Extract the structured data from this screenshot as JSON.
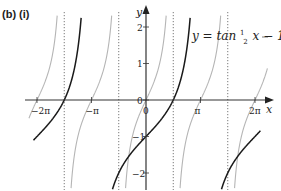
{
  "labels": {
    "part": "(b)  (i)",
    "equation_prefix": "y = tan ",
    "equation_frac_num": "1",
    "equation_frac_den": "2",
    "equation_suffix": "x − 1",
    "x_axis": "x",
    "y_axis": "y",
    "origin": "0"
  },
  "colors": {
    "main_curve": "#1a1a1a",
    "reference_curve": "#b5b5b5",
    "axes": "#333333",
    "asymptote": "#555555"
  },
  "chart_data": {
    "type": "line",
    "xlabel": "x",
    "ylabel": "y",
    "xlim": [
      -7.0,
      7.6
    ],
    "ylim": [
      -2.4,
      2.4
    ],
    "grid": false,
    "x_ticks": [
      {
        "value": -6.2832,
        "label": "−2π"
      },
      {
        "value": -3.1416,
        "label": "−π"
      },
      {
        "value": 0,
        "label": "0"
      },
      {
        "value": 3.1416,
        "label": "π"
      },
      {
        "value": 6.2832,
        "label": "2π"
      }
    ],
    "y_ticks": [
      {
        "value": 2,
        "label": "2"
      },
      {
        "value": 1,
        "label": "1"
      },
      {
        "value": 0,
        "label": "0"
      },
      {
        "value": -1,
        "label": "−1"
      },
      {
        "value": -2,
        "label": "−2"
      }
    ],
    "asymptotes_x": [
      -4.7124,
      -1.5708,
      1.5708,
      4.7124
    ],
    "series": [
      {
        "name": "y = tan ½x − 1",
        "style": "solid-black",
        "function": "tan(x/2) - 1",
        "domain": [
          -6.6,
          6.6
        ]
      },
      {
        "name": "y = tan x",
        "style": "solid-grey",
        "function": "tan(x)",
        "domain": [
          -6.6,
          6.6
        ]
      }
    ],
    "sample_points_main": [
      {
        "x": -6.2832,
        "y": -1
      },
      {
        "x": -4.7124,
        "y": 0
      },
      {
        "x": -3.6,
        "y": 2.17
      },
      {
        "x": -1.5708,
        "y": -2
      },
      {
        "x": 0,
        "y": -1
      },
      {
        "x": 1.5708,
        "y": 0
      },
      {
        "x": 2.6,
        "y": 2.3
      },
      {
        "x": 4.7124,
        "y": -2
      },
      {
        "x": 6.2832,
        "y": -1
      }
    ]
  }
}
